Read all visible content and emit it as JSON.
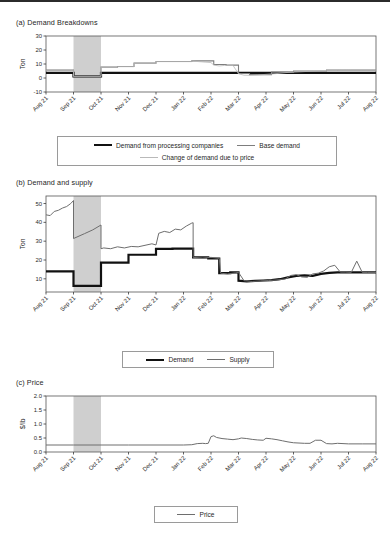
{
  "figure": {
    "top_rule": true,
    "xticks": [
      "Aug 21",
      "Sep 21",
      "Oct 21",
      "Nov 21",
      "Dec 21",
      "Jan 22",
      "Feb 22",
      "Mar 22",
      "Apr 22",
      "May 22",
      "Jun 22",
      "Jul 22",
      "Aug 22"
    ],
    "shaded_region": {
      "start": "Sep 21",
      "end": "Oct 21",
      "color": "#cfcfcf"
    },
    "colors": {
      "demand_processing": "#111111",
      "base_demand": "#7d7d7d",
      "change_of_demand": "#b9b9b9",
      "supply": "#6e6e6e",
      "price": "#6e6e6e",
      "axis": "#3a3a3a",
      "frame": "#555555"
    }
  },
  "panels": [
    {
      "id": "a",
      "title": "(a) Demand Breakdowns",
      "ylabel": "Ton",
      "yticks": [
        -10,
        0,
        10,
        20,
        30
      ],
      "ylim": [
        -10,
        30
      ],
      "legend": [
        {
          "label": "Demand from processing companies",
          "color": "#111111",
          "width": 2.2
        },
        {
          "label": "Base demand",
          "color": "#7d7d7d",
          "width": 1.1
        },
        {
          "label": "Change of demand due to price",
          "color": "#b9b9b9",
          "width": 0.8
        }
      ]
    },
    {
      "id": "b",
      "title": "(b) Demand and supply",
      "ylabel": "Ton",
      "yticks": [
        10,
        20,
        30,
        40,
        50
      ],
      "ylim": [
        3,
        54
      ],
      "legend": [
        {
          "label": "Demand",
          "color": "#111111",
          "width": 2.2
        },
        {
          "label": "Supply",
          "color": "#6e6e6e",
          "width": 1.0
        }
      ]
    },
    {
      "id": "c",
      "title": "(c) Price",
      "ylabel": "$/lb",
      "yticks": [
        0.0,
        0.5,
        1.0,
        1.5,
        2.0
      ],
      "ylim": [
        0,
        2.0
      ],
      "legend": [
        {
          "label": "Price",
          "color": "#6e6e6e",
          "width": 1.0
        }
      ]
    }
  ],
  "chart_data": [
    {
      "type": "line",
      "panel": "a",
      "title": "(a) Demand Breakdowns",
      "xlabel": "",
      "ylabel": "Ton",
      "ylim": [
        -10,
        30
      ],
      "yticks": [
        -10,
        0,
        10,
        20,
        30
      ],
      "x": [
        "Aug 21",
        "Sep 21",
        "Oct 21",
        "Nov 21",
        "Dec 21",
        "Jan 22",
        "Feb 22",
        "Mar 22",
        "Apr 22",
        "May 22",
        "Jun 22",
        "Jul 22",
        "Aug 22"
      ],
      "grid": false,
      "legend_position": "below",
      "series": [
        {
          "name": "Demand from processing companies",
          "color": "#111111",
          "x": [
            0,
            1,
            1,
            2,
            2,
            12
          ],
          "values": [
            3.6,
            3.6,
            1.2,
            1.2,
            3.6,
            3.6
          ]
        },
        {
          "name": "Base demand",
          "color": "#7d7d7d",
          "x": [
            0,
            1,
            1,
            2,
            2,
            2.6,
            2.6,
            3.2,
            3.2,
            4.0,
            4.0,
            5.3,
            5.3,
            6.1,
            6.1,
            6.55,
            6.55,
            7.0,
            7.0,
            7.4,
            7.4,
            8.2,
            8.2,
            9.0,
            9.0,
            10.2,
            10.2,
            12
          ],
          "values": [
            5.6,
            5.6,
            1.3,
            1.3,
            7.8,
            7.8,
            8.2,
            8.2,
            10.6,
            10.6,
            11.8,
            11.8,
            12.2,
            12.2,
            9.6,
            9.6,
            9.2,
            9.2,
            3.2,
            3.2,
            2.4,
            2.4,
            4.2,
            4.2,
            5.0,
            5.0,
            5.6,
            5.6
          ]
        },
        {
          "name": "Change of demand due to price",
          "color": "#b9b9b9",
          "x": [
            0,
            1,
            1,
            2,
            2,
            2.6,
            2.6,
            3.2,
            3.2,
            4.0,
            4.0,
            5.3,
            5.3,
            6.0,
            6.1,
            6.3,
            6.5,
            6.8,
            7.0,
            7.2,
            7.4,
            7.7,
            8.0,
            8.4,
            8.8,
            9.2,
            9.6,
            10.0,
            10.6,
            11.2,
            12
          ],
          "values": [
            5.5,
            5.5,
            1.2,
            1.2,
            7.7,
            7.7,
            8.1,
            8.1,
            10.5,
            10.5,
            11.7,
            11.7,
            12.1,
            11.0,
            9.2,
            8.6,
            9.0,
            9.0,
            3.0,
            2.0,
            1.9,
            2.2,
            2.6,
            3.2,
            4.0,
            4.4,
            4.8,
            5.2,
            5.4,
            5.5,
            5.6
          ]
        }
      ]
    },
    {
      "type": "line",
      "panel": "b",
      "title": "(b) Demand and supply",
      "xlabel": "",
      "ylabel": "Ton",
      "ylim": [
        3,
        54
      ],
      "yticks": [
        10,
        20,
        30,
        40,
        50
      ],
      "x": [
        "Aug 21",
        "Sep 21",
        "Oct 21",
        "Nov 21",
        "Dec 21",
        "Jan 22",
        "Feb 22",
        "Mar 22",
        "Apr 22",
        "May 22",
        "Jun 22",
        "Jul 22",
        "Aug 22"
      ],
      "grid": false,
      "legend_position": "below",
      "series": [
        {
          "name": "Demand",
          "color": "#111111",
          "x": [
            0,
            1,
            1,
            2,
            2,
            3,
            3,
            4,
            4,
            4.6,
            4.6,
            5.35,
            5.35,
            5.9,
            5.9,
            6.3,
            6.3,
            6.7,
            6.7,
            7.0,
            7.0,
            7.3,
            7.6,
            7.9,
            8.2,
            8.5,
            8.8,
            9.1,
            9.4,
            9.7,
            10.0,
            10.3,
            10.6,
            10.9,
            11.2,
            12
          ],
          "values": [
            14.0,
            14.0,
            6.3,
            6.3,
            18.6,
            18.6,
            22.8,
            22.8,
            25.9,
            25.9,
            26.0,
            26.0,
            21.4,
            21.4,
            20.8,
            20.8,
            13.0,
            13.0,
            13.4,
            13.4,
            9.0,
            8.6,
            8.9,
            9.1,
            9.3,
            9.8,
            10.8,
            11.6,
            11.8,
            11.6,
            12.6,
            13.2,
            13.4,
            13.4,
            13.4,
            13.4
          ]
        },
        {
          "name": "Supply",
          "color": "#6e6e6e",
          "x": [
            0,
            0.15,
            0.3,
            0.45,
            0.6,
            0.75,
            0.9,
            1.0,
            1.0,
            1.4,
            1.7,
            2.0,
            2.0,
            2.1,
            2.35,
            2.6,
            2.85,
            3.1,
            3.35,
            3.6,
            3.85,
            4.0,
            4.1,
            4.3,
            4.5,
            4.7,
            4.9,
            5.1,
            5.3,
            5.35,
            5.35,
            5.7,
            6.0,
            6.3,
            6.35,
            6.6,
            6.9,
            7.0,
            7.2,
            7.5,
            7.8,
            8.1,
            8.4,
            8.7,
            8.9,
            9.1,
            9.3,
            9.5,
            9.7,
            9.9,
            10.1,
            10.3,
            10.5,
            10.7,
            10.9,
            11.1,
            11.3,
            11.5,
            11.7,
            12
          ],
          "values": [
            44.0,
            43.6,
            45.8,
            46.4,
            47.6,
            48.4,
            50.0,
            51.6,
            31.4,
            34.0,
            36.0,
            38.6,
            26.0,
            26.4,
            26.0,
            27.0,
            26.4,
            27.2,
            27.0,
            27.8,
            28.6,
            28.0,
            34.2,
            35.2,
            34.6,
            36.4,
            36.0,
            38.0,
            39.6,
            39.8,
            21.4,
            21.0,
            21.4,
            20.9,
            13.0,
            12.6,
            13.2,
            13.4,
            9.0,
            8.6,
            8.9,
            9.1,
            9.4,
            9.9,
            11.8,
            12.2,
            11.0,
            10.8,
            12.6,
            13.0,
            14.2,
            16.4,
            17.2,
            13.6,
            13.6,
            13.4,
            19.4,
            13.4,
            13.4,
            13.4
          ]
        }
      ]
    },
    {
      "type": "line",
      "panel": "c",
      "title": "(c) Price",
      "xlabel": "",
      "ylabel": "$/lb",
      "ylim": [
        0,
        2.0
      ],
      "yticks": [
        0.0,
        0.5,
        1.0,
        1.5,
        2.0
      ],
      "x": [
        "Aug 21",
        "Sep 21",
        "Oct 21",
        "Nov 21",
        "Dec 21",
        "Jan 22",
        "Feb 22",
        "Mar 22",
        "Apr 22",
        "May 22",
        "Jun 22",
        "Jul 22",
        "Aug 22"
      ],
      "grid": false,
      "legend_position": "below",
      "series": [
        {
          "name": "Price",
          "color": "#6e6e6e",
          "x": [
            0,
            1,
            2,
            3,
            4,
            5,
            5.3,
            5.5,
            5.7,
            5.8,
            5.9,
            6.0,
            6.1,
            6.2,
            6.4,
            6.6,
            6.8,
            7.0,
            7.1,
            7.3,
            7.5,
            7.7,
            7.9,
            8.0,
            8.2,
            8.4,
            8.6,
            8.8,
            9.0,
            9.2,
            9.4,
            9.6,
            9.8,
            10.0,
            10.2,
            10.4,
            10.6,
            10.8,
            11.0,
            11.5,
            12
          ],
          "values": [
            0.25,
            0.25,
            0.25,
            0.25,
            0.25,
            0.25,
            0.26,
            0.3,
            0.31,
            0.3,
            0.31,
            0.55,
            0.58,
            0.52,
            0.48,
            0.46,
            0.44,
            0.47,
            0.5,
            0.48,
            0.45,
            0.43,
            0.42,
            0.49,
            0.47,
            0.44,
            0.4,
            0.36,
            0.33,
            0.32,
            0.31,
            0.31,
            0.42,
            0.42,
            0.3,
            0.29,
            0.31,
            0.3,
            0.29,
            0.29,
            0.29
          ]
        }
      ]
    }
  ]
}
